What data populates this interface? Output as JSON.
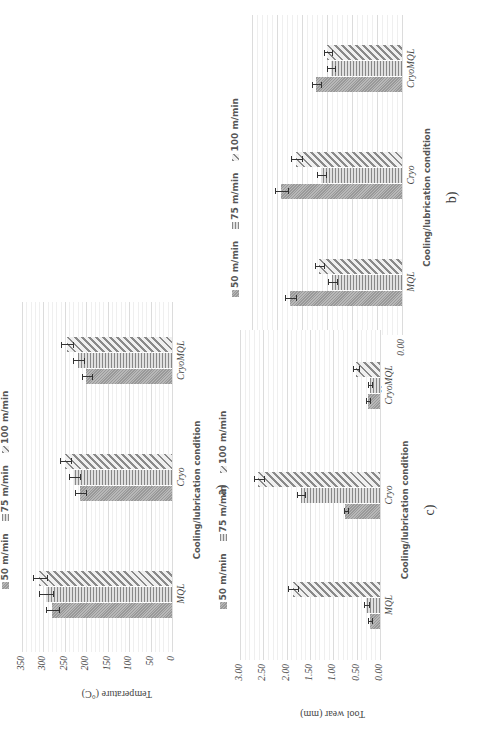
{
  "legend": [
    {
      "label": "50 m/min",
      "pattern": "dotted"
    },
    {
      "label": "75 m/min",
      "pattern": "horizontal-lines"
    },
    {
      "label": "100 m/min",
      "pattern": "diagonal-hatch"
    }
  ],
  "charts": {
    "a": {
      "caption": "a)",
      "ylabel": "Temperature (°C)",
      "xlabel": "Cooling/lubrication condition",
      "yticks": [
        "0",
        "50",
        "100",
        "150",
        "200",
        "250",
        "300",
        "350"
      ],
      "categories": [
        "MQL",
        "Cryo",
        "CryoMQL"
      ]
    },
    "b": {
      "caption": "b)",
      "ylabel": "Surface roughness, Ra (µm)",
      "xlabel": "Cooling/lubrication condition",
      "yticks": [
        "0.00",
        "0.50",
        "1.00",
        "1.50",
        "2.00",
        "2.50",
        "3.00"
      ],
      "categories": [
        "MQL",
        "Cryo",
        "CryoMQL"
      ]
    },
    "c": {
      "caption": "c)",
      "ylabel": "Tool wear (mm)",
      "xlabel": "Cooling/lubrication condition",
      "yticks": [
        "0.00",
        "0.50",
        "1.00",
        "1.50",
        "2.00",
        "2.50",
        "3.00"
      ],
      "categories": [
        "MQL",
        "Cryo",
        "CryoMQL"
      ]
    }
  },
  "chart_data": [
    {
      "type": "bar",
      "title": "a)",
      "xlabel": "Cooling/lubrication condition",
      "ylabel": "Temperature (°C)",
      "ylim": [
        0,
        350
      ],
      "grid": true,
      "legend_position": "top",
      "orientation_note": "figure rotated 90° counter-clockwise in the image",
      "categories": [
        "MQL",
        "Cryo",
        "CryoMQL"
      ],
      "series": [
        {
          "name": "50 m/min",
          "values": [
            280,
            215,
            200
          ],
          "error": [
            15,
            12,
            10
          ]
        },
        {
          "name": "75 m/min",
          "values": [
            295,
            229,
            220
          ],
          "error": [
            15,
            12,
            12
          ]
        },
        {
          "name": "100 m/min",
          "values": [
            310,
            249,
            246
          ],
          "error": [
            15,
            12,
            12
          ]
        }
      ]
    },
    {
      "type": "bar",
      "title": "b)",
      "xlabel": "Cooling/lubrication condition",
      "ylabel": "Surface roughness, Ra (µm)",
      "ylim": [
        0,
        3.0
      ],
      "grid": true,
      "legend_position": "top",
      "categories": [
        "MQL",
        "Cryo",
        "CryoMQL"
      ],
      "series": [
        {
          "name": "50 m/min",
          "values": [
            2.24,
            2.42,
            1.73
          ],
          "error": [
            0.1,
            0.12,
            0.08
          ]
        },
        {
          "name": "75 m/min",
          "values": [
            1.41,
            1.62,
            1.43
          ],
          "error": [
            0.08,
            0.08,
            0.07
          ]
        },
        {
          "name": "100 m/min",
          "values": [
            1.66,
            2.12,
            1.5
          ],
          "error": [
            0.08,
            0.1,
            0.07
          ]
        }
      ]
    },
    {
      "type": "bar",
      "title": "c)",
      "xlabel": "Cooling/lubrication condition",
      "ylabel": "Tool wear (mm)",
      "ylim": [
        0,
        3.0
      ],
      "grid": true,
      "legend_position": "top",
      "categories": [
        "MQL",
        "Cryo",
        "CryoMQL"
      ],
      "series": [
        {
          "name": "50 m/min",
          "values": [
            0.22,
            0.74,
            0.26
          ],
          "error": [
            0.03,
            0.04,
            0.03
          ]
        },
        {
          "name": "75 m/min",
          "values": [
            0.3,
            1.7,
            0.22
          ],
          "error": [
            0.04,
            0.08,
            0.03
          ]
        },
        {
          "name": "100 m/min",
          "values": [
            1.87,
            2.61,
            0.52
          ],
          "error": [
            0.1,
            0.1,
            0.05
          ]
        }
      ]
    }
  ]
}
